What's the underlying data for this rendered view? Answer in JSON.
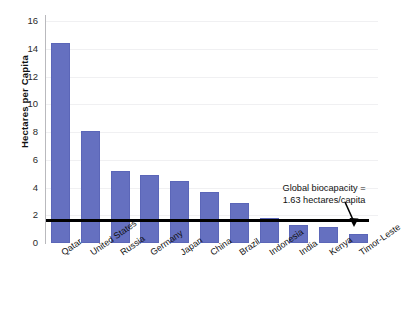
{
  "chart_data": {
    "type": "bar",
    "title": "",
    "xlabel": "",
    "ylabel": "Hectares per Capita",
    "categories": [
      "Qatar",
      "United States",
      "Russia",
      "Germany",
      "Japan",
      "China",
      "Brazil",
      "Indonesia",
      "India",
      "Kenya",
      "Timor-Leste"
    ],
    "values": [
      14.4,
      8.1,
      5.2,
      4.9,
      4.5,
      3.7,
      2.9,
      1.8,
      1.3,
      1.15,
      0.65
    ],
    "ylim": [
      0,
      16
    ],
    "yticks": [
      0,
      2,
      4,
      6,
      8,
      10,
      12,
      14,
      16
    ],
    "ytick_labels": [
      "0",
      "2",
      "4",
      "6",
      "8",
      "10",
      "12",
      "14",
      "16"
    ],
    "grid": true,
    "legend": "none",
    "series_color": "#6570c0",
    "reference_line": {
      "value": 1.63,
      "color": "#000000",
      "label_line1": "Global biocapacity =",
      "label_line2": "1.63 hectares/capita"
    },
    "annotations": [
      {
        "name": "global-biocapacity-note",
        "text_line1": "Global biocapacity =",
        "text_line2": "1.63 hectares/capita"
      }
    ]
  },
  "axis": {
    "y_title": "Hectares per Capita"
  }
}
